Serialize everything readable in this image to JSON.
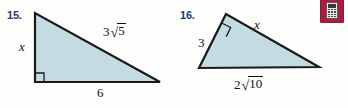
{
  "page": {
    "background_color": "#fdfdfb",
    "width": 348,
    "height": 108
  },
  "style": {
    "triangle_fill": "#c4dbe2",
    "triangle_stroke": "#1a1a1a",
    "number_color": "#1d3f6e",
    "label_color": "#111111",
    "calculator_badge_color": "#aa1f3d"
  },
  "figures": [
    {
      "number": "15.",
      "type": "right-triangle",
      "right_angle_vertex": "bottom-left",
      "labels": {
        "leg_vertical": "x",
        "hypotenuse_coefficient": "3",
        "hypotenuse_radicand": "5",
        "base": "6"
      }
    },
    {
      "number": "16.",
      "type": "right-triangle",
      "right_angle_vertex": "top",
      "labels": {
        "side_left": "3",
        "hypotenuse": "x",
        "base_coefficient": "2",
        "base_radicand": "10"
      }
    }
  ],
  "icons": {
    "calculator": "calculator-icon"
  },
  "symbols": {
    "radical_sign": "√"
  }
}
